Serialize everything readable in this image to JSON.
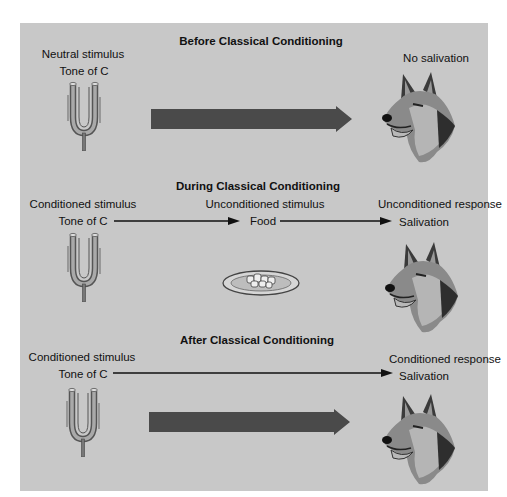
{
  "sections": [
    {
      "title": "Before Classical Conditioning",
      "left_label": "Neutral stimulus",
      "left_sublabel": "Tone of C",
      "right_label": "No salivation",
      "icons": [
        "tuning-fork-icon",
        "big-arrow-icon",
        "dog-head-icon"
      ]
    },
    {
      "title": "During Classical Conditioning",
      "left_label": "Conditioned stimulus",
      "left_sublabel": "Tone of C",
      "middle_label": "Unconditioned stimulus",
      "middle_sublabel": "Food",
      "right_label": "Unconditioned response",
      "right_sublabel": "Salivation",
      "icons": [
        "tuning-fork-icon",
        "food-plate-icon",
        "dog-head-icon"
      ]
    },
    {
      "title": "After Classical Conditioning",
      "left_label": "Conditioned stimulus",
      "left_sublabel": "Tone of C",
      "right_label": "Conditioned response",
      "right_sublabel": "Salivation",
      "icons": [
        "tuning-fork-icon",
        "big-arrow-icon",
        "dog-head-icon"
      ]
    }
  ],
  "colors": {
    "panel_bg": "#c8c8c8",
    "big_arrow": "#4a4a4a",
    "thin_arrow": "#111111"
  }
}
